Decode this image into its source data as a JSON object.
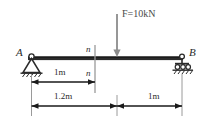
{
  "figure": {
    "type": "beam-free-body-diagram",
    "colors": {
      "beam": "#2b2b2b",
      "dimension": "#1a1a1a",
      "force_arrow": "#8c8c8c",
      "section_line": "#9a9a9a",
      "background": "#ffffff"
    },
    "supports": {
      "left": {
        "label": "A",
        "kind": "pin-support"
      },
      "right": {
        "label": "B",
        "kind": "roller-support"
      }
    },
    "load": {
      "label": "F=10kN",
      "direction": "downward"
    },
    "section": {
      "marker_top": "n",
      "marker_bottom": "n"
    },
    "dimensions": [
      {
        "label": "1m",
        "from": "A",
        "to": "section n-n"
      },
      {
        "label": "1.2m",
        "from": "A",
        "to": "load point"
      },
      {
        "label": "1m",
        "from": "load point",
        "to": "B"
      }
    ]
  }
}
